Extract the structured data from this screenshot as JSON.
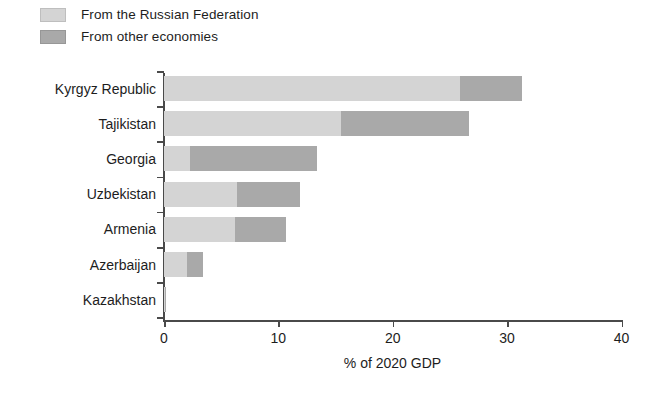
{
  "legend": {
    "position": "top-left",
    "items": [
      {
        "label": "From the Russian Federation",
        "color": "#d4d4d4",
        "key": "russian_federation"
      },
      {
        "label": "From other economies",
        "color": "#a9a9a9",
        "key": "other_economies"
      }
    ]
  },
  "axis": {
    "x_title": "% of 2020 GDP",
    "x_ticks": [
      "0",
      "10",
      "20",
      "30",
      "40"
    ],
    "x_tick_values": [
      0,
      10,
      20,
      30,
      40
    ],
    "x_min": 0,
    "x_max": 40
  },
  "chart_data": {
    "type": "bar",
    "orientation": "horizontal",
    "stacked": true,
    "title": "",
    "xlabel": "% of 2020 GDP",
    "ylabel": "",
    "xlim": [
      0,
      40
    ],
    "grid": false,
    "legend_position": "top-left",
    "categories": [
      "Kyrgyz Republic",
      "Tajikistan",
      "Georgia",
      "Uzbekistan",
      "Armenia",
      "Azerbaijan",
      "Kazakhstan"
    ],
    "series": [
      {
        "name": "From the Russian Federation",
        "color": "#d4d4d4",
        "values": [
          25.9,
          15.5,
          2.3,
          6.4,
          6.2,
          2.0,
          0.1
        ]
      },
      {
        "name": "From other economies",
        "color": "#a9a9a9",
        "values": [
          5.4,
          11.2,
          11.1,
          5.5,
          4.5,
          1.4,
          0.1
        ]
      }
    ],
    "totals": [
      31.3,
      26.7,
      13.4,
      11.9,
      10.7,
      3.4,
      0.2
    ]
  },
  "colors": {
    "series_light": "#d4d4d4",
    "series_dark": "#a9a9a9",
    "axis": "#4a4a4a",
    "text": "#1d1d1d",
    "background": "#ffffff"
  }
}
